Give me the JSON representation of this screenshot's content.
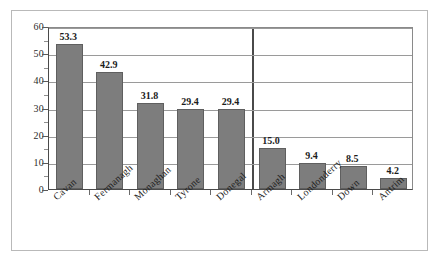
{
  "chart_data": {
    "type": "bar",
    "title": "",
    "subtitle": "",
    "xlabel": "",
    "ylabel": "",
    "ylim": [
      0,
      60
    ],
    "yticks": [
      0,
      10,
      20,
      30,
      40,
      50,
      60
    ],
    "ytick_labels": [
      "0",
      "10",
      "20",
      "30",
      "40",
      "50",
      "60"
    ],
    "grid": true,
    "grid_axis": "y",
    "legend": false,
    "legend_position": "none",
    "orientation": "vertical",
    "bar_color": "#7d7d7d",
    "bar_edge_color": "#5f5f5f",
    "gridline_color": "#9a9a9a",
    "axis_color": "#4a4a4a",
    "frame_color": "#b9b9b9",
    "categories": [
      "Cavan",
      "Fermanagh",
      "Monaghan",
      "Tyrone",
      "Donegal",
      "Armagh",
      "Londonderry",
      "Down",
      "Antrim"
    ],
    "values": [
      53.3,
      42.9,
      31.8,
      29.4,
      29.4,
      15.0,
      9.4,
      8.5,
      4.2
    ],
    "data_labels": [
      "53.3",
      "42.9",
      "31.8",
      "29.4",
      "29.4",
      "15.0",
      "9.4",
      "8.5",
      "4.2"
    ],
    "groups": [
      {
        "name": "group-left",
        "category_indices": [
          0,
          1,
          2,
          3,
          4
        ]
      },
      {
        "name": "group-right",
        "category_indices": [
          5,
          6,
          7,
          8
        ]
      }
    ],
    "divider_after_category_index": 4,
    "annotations": []
  }
}
